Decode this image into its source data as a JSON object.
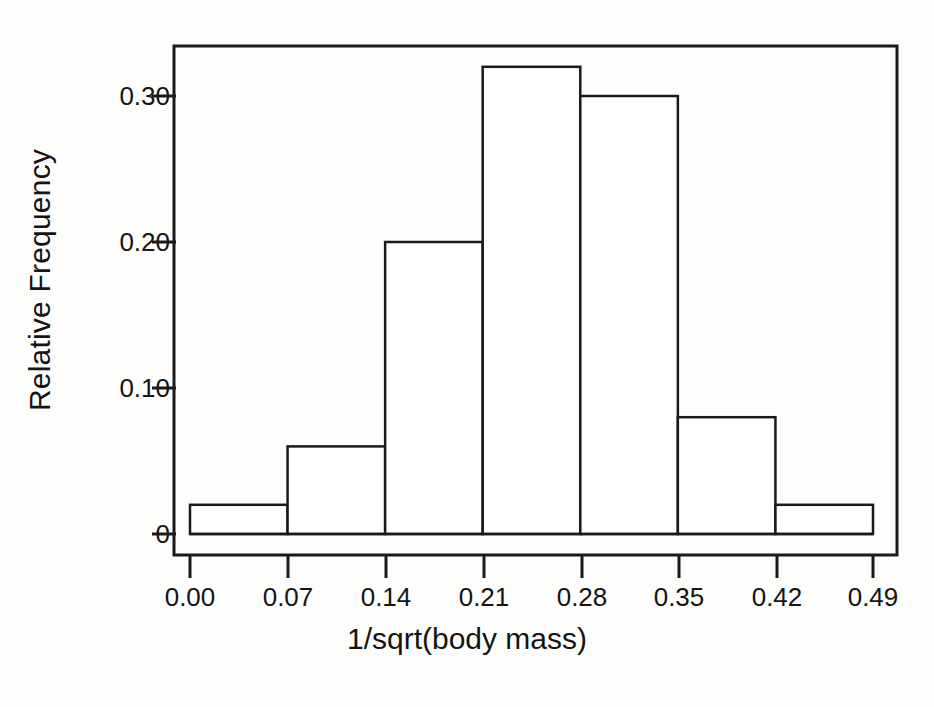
{
  "chart_data": {
    "type": "bar",
    "chart_subtype": "histogram",
    "title": "",
    "subtitle": "",
    "xlabel": "1/sqrt(body mass)",
    "ylabel": "Relative Frequency",
    "xlim": [
      0.0,
      0.49
    ],
    "ylim": [
      0,
      0.335
    ],
    "grid": false,
    "legend": null,
    "legend_position": "none",
    "bin_width": 0.07,
    "bin_edges": [
      0.0,
      0.07,
      0.14,
      0.21,
      0.28,
      0.35,
      0.42,
      0.49
    ],
    "categories": [
      "0.00-0.07",
      "0.07-0.14",
      "0.14-0.21",
      "0.21-0.28",
      "0.28-0.35",
      "0.35-0.42",
      "0.42-0.49"
    ],
    "values": [
      0.02,
      0.06,
      0.2,
      0.32,
      0.3,
      0.08,
      0.02
    ],
    "x_tick_labels": [
      "0.00",
      "0.07",
      "0.14",
      "0.21",
      "0.28",
      "0.35",
      "0.42",
      "0.49"
    ],
    "x_tick_values": [
      0.0,
      0.07,
      0.14,
      0.21,
      0.28,
      0.35,
      0.42,
      0.49
    ],
    "y_tick_labels": [
      "0",
      "0.10",
      "0.20",
      "0.30"
    ],
    "y_tick_values": [
      0,
      0.1,
      0.2,
      0.3
    ],
    "bar_fill_color": "#ffffff",
    "bar_edge_color": "#1a1a1a",
    "axis_color": "#1a1a1a",
    "background_color": "#fdfdfb",
    "frame_box": true,
    "annotations": []
  }
}
